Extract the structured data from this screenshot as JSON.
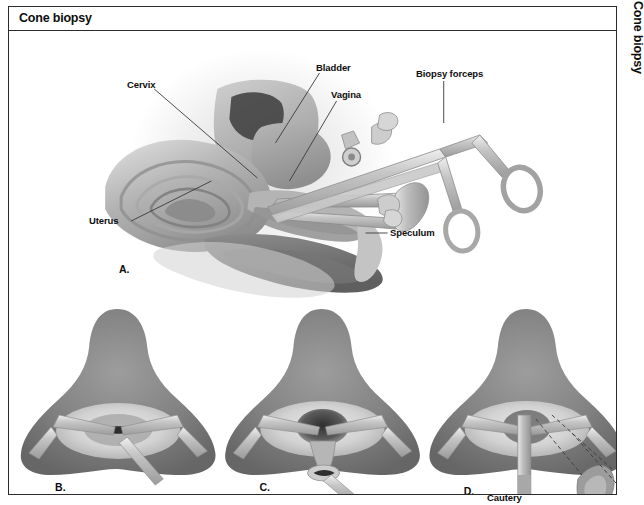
{
  "figure": {
    "title": "Cone biopsy",
    "edge_tab_label": "Cone biopsy",
    "border_color": "#2b2b2b",
    "background_color": "#ffffff",
    "ink_color": "#0d0d0d"
  },
  "panel_a": {
    "panel_label": "A.",
    "description": "Sagittal cross-section of the female pelvis with speculum and biopsy forceps in place",
    "callouts": [
      {
        "id": "cervix",
        "label": "Cervix"
      },
      {
        "id": "bladder",
        "label": "Bladder"
      },
      {
        "id": "vagina",
        "label": "Vagina"
      },
      {
        "id": "biopsy-forceps",
        "label": "Biopsy forceps"
      },
      {
        "id": "uterus",
        "label": "Uterus"
      },
      {
        "id": "speculum",
        "label": "Speculum"
      }
    ]
  },
  "panel_b": {
    "panel_label": "B.",
    "description": "Cervix viewed through the speculum before excision, os visible as a slit"
  },
  "panel_c": {
    "panel_label": "C.",
    "description": "Conical wedge of tissue excised from the cervix leaving a dark cone-shaped defect"
  },
  "panel_d": {
    "panel_label": "D.",
    "description": "Cautery applied to the cone bed with the removed cone specimen shown beside it",
    "callouts": [
      {
        "id": "cautery",
        "label": "Cautery"
      }
    ]
  },
  "palette": {
    "tissue_dark": "#6f6f6f",
    "tissue_mid": "#9a9a9a",
    "tissue_light": "#c8c8c8",
    "tissue_pale": "#e4e4e4",
    "instrument": "#b9b9b9",
    "instrument_edge": "#8a8a8a",
    "leader_line": "#3a3a3a"
  }
}
